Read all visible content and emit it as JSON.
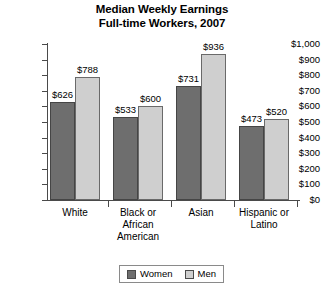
{
  "chart_data": {
    "type": "bar",
    "title": "Median Weekly Earnings\nFull-time Workers, 2007",
    "title_line1": "Median Weekly Earnings",
    "title_line2": "Full-time Workers, 2007",
    "xlabel": "",
    "ylabel": "",
    "ylim": [
      0,
      1000
    ],
    "grid": false,
    "legend_position": "bottom-center",
    "categories": [
      "White",
      "Black or African American",
      "Asian",
      "Hispanic or Latino"
    ],
    "category_display": [
      "White",
      "Black or\nAfrican\nAmerican",
      "Asian",
      "Hispanic or\nLatino"
    ],
    "ytick_labels": [
      "$0",
      "$100",
      "$200",
      "$300",
      "$400",
      "$500",
      "$600",
      "$700",
      "$800",
      "$900",
      "$1,000"
    ],
    "ytick_values": [
      0,
      100,
      200,
      300,
      400,
      500,
      600,
      700,
      800,
      900,
      1000
    ],
    "series": [
      {
        "name": "Women",
        "color": "#6e6e6e",
        "values": [
          626,
          533,
          731,
          473
        ],
        "labels": [
          "$626",
          "$533",
          "$731",
          "$473"
        ]
      },
      {
        "name": "Men",
        "color": "#cfcfcf",
        "values": [
          788,
          600,
          936,
          520
        ],
        "labels": [
          "$788",
          "$600",
          "$936",
          "$520"
        ]
      }
    ]
  },
  "legend": {
    "items": [
      {
        "label": "Women",
        "color": "#6e6e6e"
      },
      {
        "label": "Men",
        "color": "#cfcfcf"
      }
    ]
  }
}
